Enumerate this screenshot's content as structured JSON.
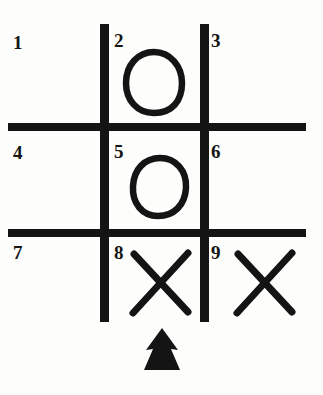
{
  "figure": {
    "background_color": "#fdfdfb",
    "ink_color": "#141414"
  },
  "grid": {
    "label": "tic-tac-toe grid",
    "vertical_lines": [
      {
        "x": 104,
        "y_top": 24,
        "y_bottom": 322,
        "thickness": 9
      },
      {
        "x": 204,
        "y_top": 24,
        "y_bottom": 322,
        "thickness": 9
      }
    ],
    "horizontal_lines": [
      {
        "y": 127,
        "x_left": 8,
        "x_right": 306,
        "thickness": 8
      },
      {
        "y": 233,
        "x_left": 8,
        "x_right": 306,
        "thickness": 8
      }
    ]
  },
  "cells": [
    {
      "number": "1",
      "row": 1,
      "col": 1,
      "mark": ""
    },
    {
      "number": "2",
      "row": 1,
      "col": 2,
      "mark": "O"
    },
    {
      "number": "3",
      "row": 1,
      "col": 3,
      "mark": ""
    },
    {
      "number": "4",
      "row": 2,
      "col": 1,
      "mark": ""
    },
    {
      "number": "5",
      "row": 2,
      "col": 2,
      "mark": "O"
    },
    {
      "number": "6",
      "row": 2,
      "col": 3,
      "mark": ""
    },
    {
      "number": "7",
      "row": 3,
      "col": 1,
      "mark": ""
    },
    {
      "number": "8",
      "row": 3,
      "col": 2,
      "mark": "X"
    },
    {
      "number": "9",
      "row": 3,
      "col": 3,
      "mark": "X"
    }
  ],
  "marks": {
    "o_marks": [
      {
        "cell": "2",
        "cx": 154,
        "cy": 82,
        "rx": 27,
        "ry": 30
      },
      {
        "cell": "5",
        "cx": 159,
        "cy": 187,
        "rx": 26,
        "ry": 29
      }
    ],
    "x_marks": [
      {
        "cell": "8",
        "cx": 160,
        "cy": 283,
        "half": 28
      },
      {
        "cell": "9",
        "cx": 264,
        "cy": 283,
        "half": 28
      }
    ]
  },
  "pointer": {
    "name": "up-arrow",
    "direction": "up",
    "points_at_cell": "8",
    "x": 162,
    "y_top": 328,
    "y_bottom": 370,
    "width": 37
  }
}
